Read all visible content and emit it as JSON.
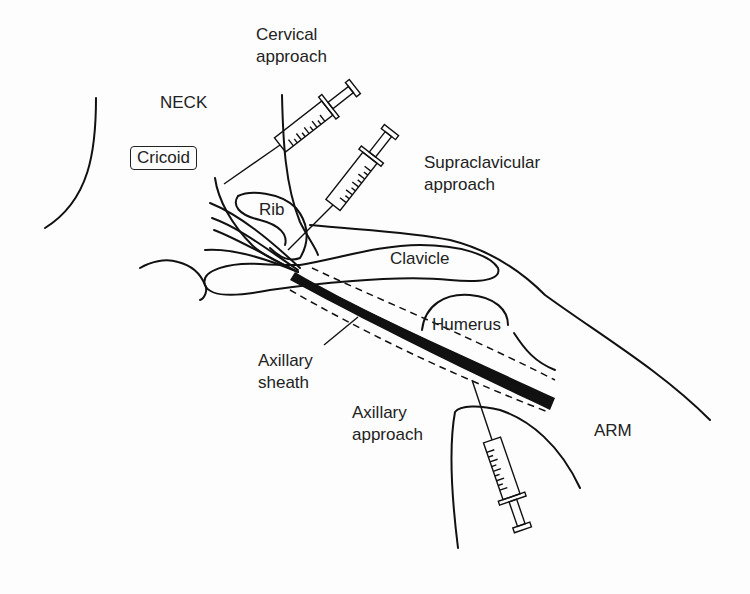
{
  "diagram": {
    "type": "anatomical-illustration",
    "regions": {
      "neck": "NECK",
      "arm": "ARM"
    },
    "structures": {
      "cricoid": "Cricoid",
      "rib": "Rib",
      "clavicle": "Clavicle",
      "humerus": "Humerus",
      "axillary_sheath_line1": "Axillary",
      "axillary_sheath_line2": "sheath"
    },
    "approaches": {
      "cervical_line1": "Cervical",
      "cervical_line2": "approach",
      "supraclavicular_line1": "Supraclavicular",
      "supraclavicular_line2": "approach",
      "axillary_line1": "Axillary",
      "axillary_line2": "approach"
    }
  }
}
